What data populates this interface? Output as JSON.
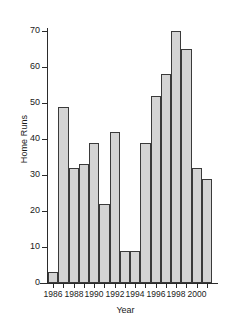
{
  "chart_data": {
    "type": "bar",
    "title": "",
    "xlabel": "Year",
    "ylabel": "Home Runs",
    "categories": [
      1986,
      1987,
      1988,
      1989,
      1990,
      1991,
      1992,
      1993,
      1994,
      1995,
      1996,
      1997,
      1998,
      1999,
      2000,
      2001
    ],
    "values": [
      3,
      49,
      32,
      33,
      39,
      22,
      42,
      9,
      9,
      39,
      52,
      58,
      70,
      65,
      32,
      29
    ],
    "ylim": [
      0,
      72
    ],
    "ytick_labels": [
      "0",
      "10",
      "20",
      "30",
      "40",
      "50",
      "60",
      "70"
    ],
    "ytick_values": [
      0,
      10,
      20,
      30,
      40,
      50,
      60,
      70
    ],
    "xtick_labels": [
      "1986",
      "1988",
      "1990",
      "1992",
      "1994",
      "1996",
      "1998",
      "2000"
    ],
    "xtick_values": [
      1986,
      1988,
      1990,
      1992,
      1994,
      1996,
      1998,
      2000
    ],
    "grid": false,
    "legend": "none",
    "bar_fill_color": "#d4d4d4",
    "bar_edge_color": "#3a3a3a",
    "axis_color": "#2b2b2b",
    "background_color": "#ffffff"
  },
  "axes": {
    "y_title": "Home Runs",
    "x_title": "Year"
  }
}
